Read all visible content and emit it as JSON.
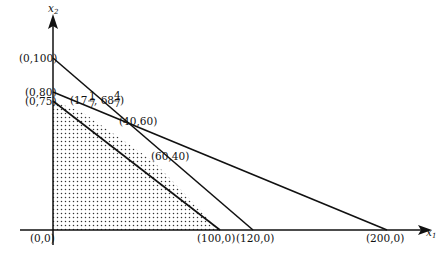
{
  "diagram": {
    "type": "linear-programming-feasible-region",
    "axes": {
      "x_label": "x",
      "x_sub": "1",
      "y_label": "x",
      "y_sub": "2"
    },
    "lines": [
      {
        "name": "line-a",
        "from": "(0,100)",
        "to": "(120,0)"
      },
      {
        "name": "line-b",
        "from": "(0,80)",
        "to": "(200,0)"
      },
      {
        "name": "line-c",
        "from": "(0,75)",
        "to": "(100,0)"
      }
    ],
    "feasible_region": {
      "pattern": "dotted",
      "vertices": [
        "(0,0)",
        "(0,75)",
        "(17 1/7, 68 4/7)",
        "(60,40)",
        "(100,0)"
      ]
    },
    "point_labels": {
      "origin": "(0,0)",
      "y100": "(0,100)",
      "y80": "(0,80)",
      "y75": "(0,75)",
      "p1_pre": "(17",
      "p1_frac1_num": "1",
      "p1_frac1_den": "7",
      "p1_mid": ", 68",
      "p1_frac2_num": "4",
      "p1_frac2_den": "7",
      "p1_post": ")",
      "p2": "(40,60)",
      "p3": "(60,40)",
      "x100": "(100,0)",
      "x120": "(120,0)",
      "x200": "(200,0)"
    },
    "colors": {
      "stroke": "#111111",
      "dots": "#333333",
      "background": "#ffffff"
    }
  }
}
